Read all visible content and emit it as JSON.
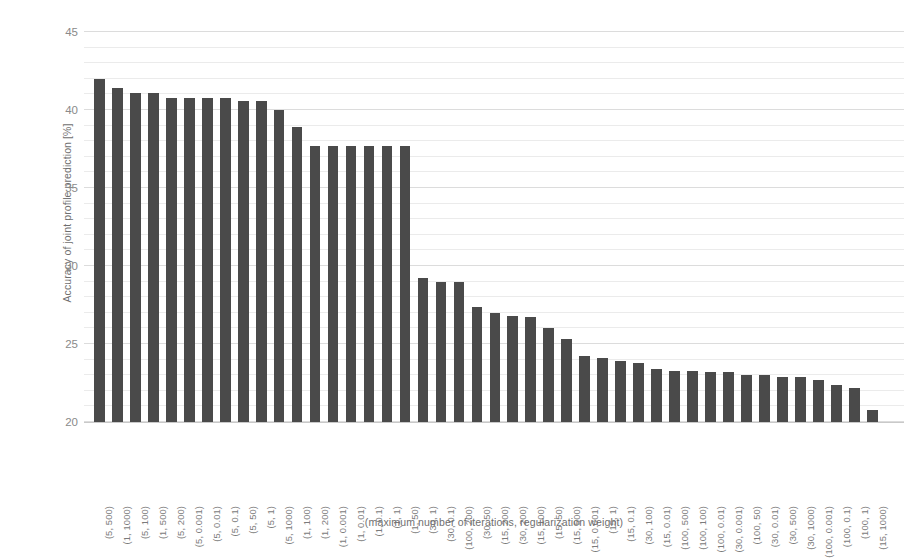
{
  "chart_data": {
    "type": "bar",
    "title": "",
    "xlabel": "(maximum number of iterations, regularization weight)",
    "ylabel": "Accuracy of joint profile prediction [%]",
    "ylim": [
      20,
      45
    ],
    "yticks": [
      20,
      25,
      30,
      35,
      40,
      45
    ],
    "ytick_labels": [
      "20",
      "25",
      "30",
      "35",
      "40",
      "45"
    ],
    "minor_gridlines": true,
    "minor_tick_step": 1,
    "grid": true,
    "legend": null,
    "bar_color": "#4a4a4a",
    "categories": [
      "(5, 500)",
      "(1, 1000)",
      "(5, 100)",
      "(1, 500)",
      "(5, 200)",
      "(5, 0.001)",
      "(5, 0.01)",
      "(5, 0.1)",
      "(5, 50)",
      "(5, 1)",
      "(5, 1000)",
      "(1, 100)",
      "(1, 200)",
      "(1, 0.001)",
      "(1, 0.01)",
      "(1, 0.1)",
      "(1, 1)",
      "(1, 50)",
      "(30, 1)",
      "(30, 0.1)",
      "(100, 200)",
      "(30, 50)",
      "(15, 200)",
      "(30, 200)",
      "(15, 100)",
      "(15, 50)",
      "(15, 500)",
      "(15, 0.001)",
      "(15, 1)",
      "(15, 0.1)",
      "(30, 100)",
      "(15, 0.01)",
      "(100, 500)",
      "(100, 100)",
      "(100, 0.01)",
      "(30, 0.001)",
      "(100, 50)",
      "(30, 0.01)",
      "(30, 500)",
      "(30, 1000)",
      "(100, 0.001)",
      "(100, 0.1)",
      "(100, 1)",
      "(15, 1000)"
    ],
    "values": [
      42.0,
      41.4,
      41.1,
      41.1,
      40.8,
      40.8,
      40.8,
      40.8,
      40.6,
      40.6,
      40.0,
      38.9,
      37.7,
      37.7,
      37.7,
      37.7,
      37.7,
      37.7,
      29.2,
      29.0,
      29.0,
      27.4,
      27.0,
      26.8,
      26.7,
      26.0,
      25.3,
      24.2,
      24.1,
      23.9,
      23.8,
      23.4,
      23.3,
      23.3,
      23.2,
      23.2,
      23.0,
      23.0,
      22.9,
      22.9,
      22.7,
      22.4,
      22.2,
      20.8
    ]
  },
  "axis": {
    "y_title": "Accuracy of joint profile prediction [%]",
    "x_title": "(maximum number of iterations, regularization weight)"
  }
}
